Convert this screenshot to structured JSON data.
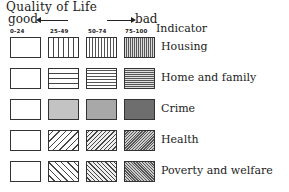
{
  "title": "Quality of Life",
  "scale": {
    "good_label": "good",
    "bad_label": "bad",
    "ranges": [
      "0-24",
      "25-49",
      "50-74",
      "75-100"
    ]
  },
  "indicator_header": "Indicator",
  "indicators": [
    {
      "label": "Housing",
      "pattern": "vertical lines"
    },
    {
      "label": "Home and family",
      "pattern": "horizontal lines"
    },
    {
      "label": "Crime",
      "pattern": "stipple / gray shading"
    },
    {
      "label": "Health",
      "pattern": "forward diagonal hatching"
    },
    {
      "label": "Poverty and welfare",
      "pattern": "backward diagonal hatching"
    }
  ]
}
